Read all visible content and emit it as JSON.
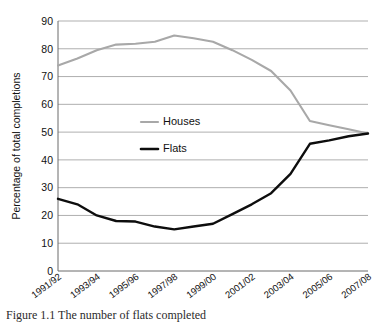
{
  "figure": {
    "caption": "Figure 1.1  The number of flats completed"
  },
  "chart_data": {
    "type": "line",
    "title": "",
    "xlabel": "",
    "ylabel": "Percentage of total completions",
    "ylim": [
      0,
      90
    ],
    "ytick_step": 10,
    "yticks": [
      0,
      10,
      20,
      30,
      40,
      50,
      60,
      70,
      80,
      90
    ],
    "ytick_labels": [
      "0",
      "10",
      "20",
      "30",
      "40",
      "50",
      "60",
      "70",
      "80",
      "90"
    ],
    "grid": true,
    "legend_position": "inside-left-middle",
    "categories": [
      "1991/92",
      "1992/93",
      "1993/94",
      "1994/95",
      "1995/96",
      "1996/97",
      "1997/98",
      "1998/99",
      "1999/00",
      "2000/01",
      "2001/02",
      "2002/03",
      "2003/04",
      "2004/05",
      "2005/06",
      "2006/07",
      "2007/08"
    ],
    "xtick_labels": [
      "1991/92",
      "1993/94",
      "1995/96",
      "1997/98",
      "1999/00",
      "2001/02",
      "2003/04",
      "2005/06",
      "2007/08"
    ],
    "xtick_indices": [
      0,
      2,
      4,
      6,
      8,
      10,
      12,
      14,
      16
    ],
    "series": [
      {
        "name": "Houses",
        "color": "#a8a8a8",
        "values": [
          74,
          76.5,
          79.5,
          81.5,
          81.8,
          82.5,
          84.8,
          83.8,
          82.5,
          79.5,
          76,
          72,
          65,
          54,
          52.5,
          51,
          49.5
        ]
      },
      {
        "name": "Flats",
        "color": "#0d0d0d",
        "values": [
          26,
          24,
          20,
          18,
          17.8,
          16,
          15,
          16,
          17,
          20.5,
          24,
          28,
          35,
          45.8,
          47,
          48.5,
          49.5
        ]
      }
    ]
  }
}
